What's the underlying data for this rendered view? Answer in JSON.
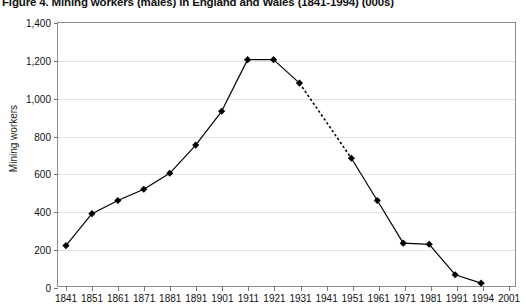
{
  "chart_data": {
    "type": "line",
    "title": "Figure 4. Mining workers (males) in England and Wales (1841-1994) (000s)",
    "xlabel": "",
    "ylabel": "Mining workers",
    "ylim": [
      0,
      1400
    ],
    "ytick_step": 200,
    "ytick_labels": [
      "0",
      "200",
      "400",
      "600",
      "800",
      "1,000",
      "1,200",
      "1,400"
    ],
    "ytick_values": [
      0,
      200,
      400,
      600,
      800,
      1000,
      1200,
      1400
    ],
    "xtick_labels": [
      "1841",
      "1851",
      "1861",
      "1871",
      "1881",
      "1891",
      "1901",
      "1911",
      "1921",
      "1931",
      "1941",
      "1951",
      "1961",
      "1971",
      "1981",
      "1991",
      "1994",
      "2001"
    ],
    "grid": true,
    "legend": "none",
    "marker": "diamond",
    "marker_color": "#000000",
    "line_color": "#000000",
    "grid_color": "#e2e2e2",
    "axis_color": "#8c8c8c",
    "categories": [
      "1841",
      "1851",
      "1861",
      "1871",
      "1881",
      "1891",
      "1901",
      "1911",
      "1921",
      "1931",
      "1941",
      "1951",
      "1961",
      "1971",
      "1981",
      "1991",
      "1994"
    ],
    "values": [
      215,
      385,
      455,
      515,
      600,
      750,
      930,
      1205,
      1205,
      1080,
      null,
      680,
      455,
      228,
      222,
      60,
      15
    ],
    "dashed_segments": [
      [
        "1931",
        "1951"
      ]
    ]
  }
}
